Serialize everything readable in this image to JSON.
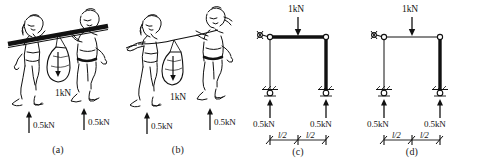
{
  "figure": {
    "panels": [
      {
        "id": "a",
        "caption": "(a)",
        "kind": "sketch-rigid-pole",
        "description": "Two people carrying a rigid pole with a load hanging from its midpoint",
        "load_label": "1kN",
        "reaction_left_label": "0.5kN",
        "reaction_right_label": "0.5kN"
      },
      {
        "id": "b",
        "caption": "(b)",
        "kind": "sketch-flexible-rope",
        "description": "Two people carrying a flexible rope with a load hanging from its midpoint",
        "load_label": "1kN",
        "reaction_left_label": "0.5kN",
        "reaction_right_label": "0.5kN"
      },
      {
        "id": "c",
        "caption": "(c)",
        "kind": "frame-diagram",
        "description": "Portal frame: stiff top beam and stiff right column, thin left column",
        "load_label": "1kN",
        "reaction_left_label": "0.5kN",
        "reaction_right_label": "0.5kN",
        "dim_left_label": "l/2",
        "dim_right_label": "l/2",
        "members": {
          "top_beam": "thick",
          "left_column": "thin",
          "right_column": "thick"
        }
      },
      {
        "id": "d",
        "caption": "(d)",
        "kind": "frame-diagram",
        "description": "Portal frame: thin top beam and thin left column, stiff right column",
        "load_label": "1kN",
        "reaction_left_label": "0.5kN",
        "reaction_right_label": "0.5kN",
        "dim_left_label": "l/2",
        "dim_right_label": "l/2",
        "members": {
          "top_beam": "thin",
          "left_column": "thin",
          "right_column": "thick"
        }
      }
    ],
    "colors": {
      "ink": "#111111",
      "background": "#ffffff"
    }
  }
}
